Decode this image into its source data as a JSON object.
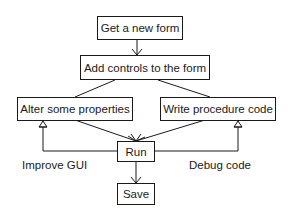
{
  "diagram": {
    "type": "flowchart",
    "nodes": {
      "get_form": "Get a new form",
      "add_controls": "Add controls to the form",
      "alter_props": "Alter some properties",
      "write_code": "Write procedure code",
      "run": "Run",
      "save": "Save"
    },
    "edge_labels": {
      "improve_gui": "Improve GUI",
      "debug_code": "Debug code"
    },
    "edges": [
      {
        "from": "get_form",
        "to": "add_controls"
      },
      {
        "from": "add_controls",
        "to": "alter_props"
      },
      {
        "from": "add_controls",
        "to": "write_code"
      },
      {
        "from": "alter_props",
        "to": "run"
      },
      {
        "from": "write_code",
        "to": "run"
      },
      {
        "from": "run",
        "to": "alter_props",
        "label": "Improve GUI"
      },
      {
        "from": "run",
        "to": "write_code",
        "label": "Debug code"
      },
      {
        "from": "run",
        "to": "save"
      }
    ]
  }
}
